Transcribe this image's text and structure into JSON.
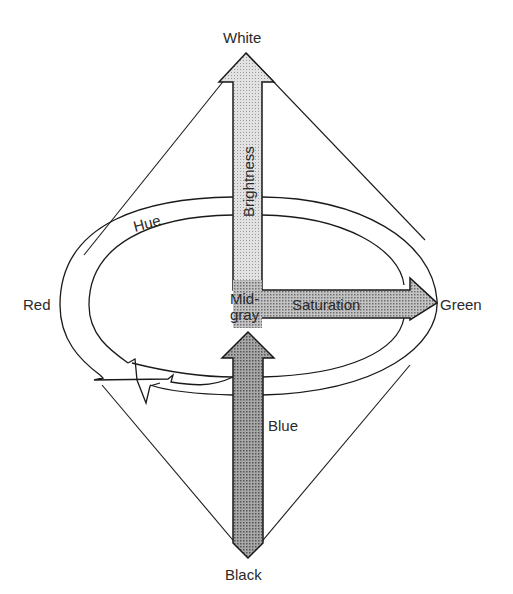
{
  "diagram": {
    "labels": {
      "top": "White",
      "bottom": "Black",
      "left": "Red",
      "right": "Green",
      "lower": "Blue",
      "hue": "Hue",
      "brightness": "Brightness",
      "saturation": "Saturation",
      "center_line1": "Mid-",
      "center_line2": "gray"
    },
    "colors": {
      "stroke": "#1a1a1a",
      "light_fill": "#d4d4d4",
      "mid_fill": "#b0b0b0",
      "dark_fill": "#9a9a9a",
      "background": "#ffffff"
    }
  }
}
